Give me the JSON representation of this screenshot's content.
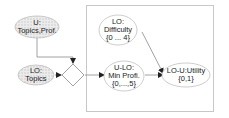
{
  "diagram": {
    "type": "influence-diagram",
    "colors": {
      "stroke": "#8a8a8a",
      "box_stroke": "#c8c8c8",
      "hatched_fill": "#e4e4e4",
      "plain_fill": "#ffffff",
      "text": "#222222"
    },
    "nodes": [
      {
        "id": "u_topics_prof",
        "shape": "ellipse",
        "style": "hatched",
        "lines": [
          "U:",
          "Topics,Prof."
        ]
      },
      {
        "id": "lo_topics",
        "shape": "ellipse",
        "style": "hatched",
        "lines": [
          "LO:",
          "Topics"
        ]
      },
      {
        "id": "decision",
        "shape": "diamond",
        "style": "plain",
        "lines": []
      },
      {
        "id": "lo_difficulty",
        "shape": "ellipse",
        "style": "plain",
        "lines": [
          "LO:",
          "Difficulty",
          "{0 ... 4}"
        ]
      },
      {
        "id": "ulo_min_profi",
        "shape": "ellipse",
        "style": "plain",
        "lines": [
          "U-LO:",
          "Min Profi.",
          "{0,...,5}"
        ]
      },
      {
        "id": "lo_u_utility",
        "shape": "ellipse",
        "style": "plain",
        "lines": [
          "LO-U:Utility",
          "{0,1}"
        ]
      }
    ],
    "edges": [
      {
        "from": "u_topics_prof",
        "to": "decision"
      },
      {
        "from": "lo_topics",
        "to": "decision"
      },
      {
        "from": "decision",
        "to": "ulo_min_profi"
      },
      {
        "from": "ulo_min_profi",
        "to": "lo_u_utility"
      },
      {
        "from": "lo_difficulty",
        "to": "lo_u_utility"
      }
    ],
    "group_box": {
      "contains": [
        "lo_difficulty",
        "ulo_min_profi",
        "lo_u_utility"
      ]
    }
  }
}
